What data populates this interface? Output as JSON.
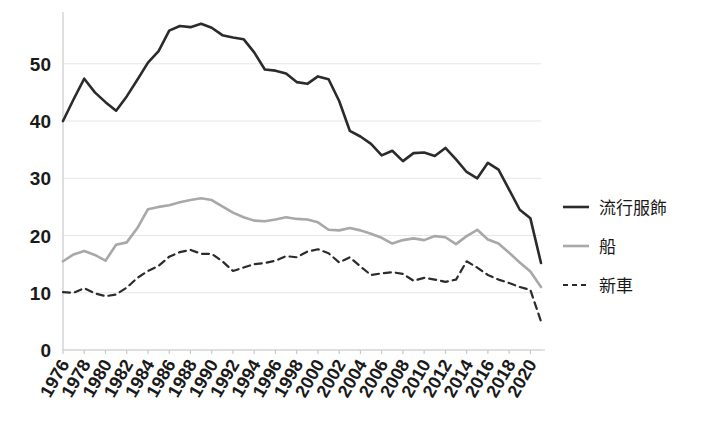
{
  "chart_data": {
    "type": "line",
    "title": "",
    "xlabel": "",
    "ylabel": "",
    "xlim": [
      1976,
      2021
    ],
    "ylim": [
      0,
      58
    ],
    "yticks": [
      0,
      10,
      20,
      30,
      40,
      50
    ],
    "grid": true,
    "legend_position": "right",
    "x": [
      1976,
      1977,
      1978,
      1979,
      1980,
      1981,
      1982,
      1983,
      1984,
      1985,
      1986,
      1987,
      1988,
      1989,
      1990,
      1991,
      1992,
      1993,
      1994,
      1995,
      1996,
      1997,
      1998,
      1999,
      2000,
      2001,
      2002,
      2003,
      2004,
      2005,
      2006,
      2007,
      2008,
      2009,
      2010,
      2011,
      2012,
      2013,
      2014,
      2015,
      2016,
      2017,
      2018,
      2019,
      2020,
      2021
    ],
    "xtick_labels": [
      "1976",
      "1978",
      "1980",
      "1982",
      "1984",
      "1986",
      "1988",
      "1990",
      "1992",
      "1994",
      "1996",
      "1998",
      "2000",
      "2002",
      "2004",
      "2006",
      "2008",
      "2010",
      "2012",
      "2014",
      "2016",
      "2018",
      "2020"
    ],
    "xticks": [
      1976,
      1978,
      1980,
      1982,
      1984,
      1986,
      1988,
      1990,
      1992,
      1994,
      1996,
      1998,
      2000,
      2002,
      2004,
      2006,
      2008,
      2010,
      2012,
      2014,
      2016,
      2018,
      2020
    ],
    "series": [
      {
        "name": "流行服飾",
        "style": "solid",
        "color": "#2b2b2b",
        "width": 2.6,
        "values": [
          40.0,
          43.8,
          47.4,
          45.0,
          43.3,
          41.8,
          44.3,
          47.2,
          50.2,
          52.2,
          55.8,
          56.6,
          56.4,
          57.0,
          56.3,
          55.0,
          54.6,
          54.3,
          52.0,
          49.0,
          48.8,
          48.3,
          46.8,
          46.5,
          47.8,
          47.3,
          43.5,
          38.3,
          37.3,
          36.0,
          34.0,
          34.8,
          33.0,
          34.4,
          34.5,
          33.9,
          35.3,
          33.3,
          31.1,
          30.0,
          32.7,
          31.5,
          28.0,
          24.5,
          23.0,
          15.2
        ]
      },
      {
        "name": "船",
        "style": "solid",
        "color": "#a8a8a8",
        "width": 2.6,
        "values": [
          15.5,
          16.7,
          17.3,
          16.6,
          15.6,
          18.4,
          18.8,
          21.3,
          24.6,
          25.0,
          25.3,
          25.8,
          26.2,
          26.5,
          26.2,
          25.1,
          24.0,
          23.2,
          22.6,
          22.5,
          22.8,
          23.2,
          22.9,
          22.8,
          22.3,
          21.0,
          20.9,
          21.3,
          20.9,
          20.3,
          19.6,
          18.6,
          19.2,
          19.5,
          19.2,
          19.9,
          19.7,
          18.5,
          19.9,
          21.0,
          19.3,
          18.6,
          17.0,
          15.3,
          13.7,
          11.0
        ]
      },
      {
        "name": "新車",
        "style": "dashed",
        "color": "#2b2b2b",
        "width": 2.2,
        "values": [
          10.1,
          10.0,
          10.8,
          9.9,
          9.4,
          9.7,
          10.9,
          12.6,
          13.8,
          14.7,
          16.3,
          17.1,
          17.5,
          16.8,
          16.8,
          15.5,
          13.8,
          14.4,
          15.0,
          15.2,
          15.6,
          16.4,
          16.2,
          17.2,
          17.6,
          16.9,
          15.3,
          16.2,
          14.6,
          13.1,
          13.4,
          13.6,
          13.3,
          12.1,
          12.6,
          12.3,
          11.9,
          12.3,
          15.5,
          14.4,
          13.1,
          12.3,
          11.7,
          11.0,
          10.5,
          5.0
        ]
      }
    ]
  },
  "legend": {
    "items": [
      {
        "label": "流行服飾"
      },
      {
        "label": "船"
      },
      {
        "label": "新車"
      }
    ]
  }
}
